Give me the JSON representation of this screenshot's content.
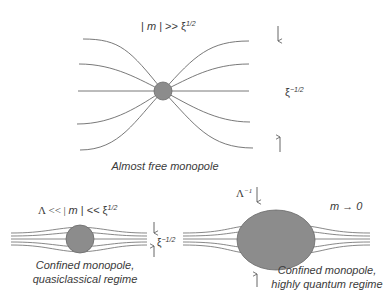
{
  "panels": {
    "free": {
      "condition": {
        "lhs": "| ",
        "var": "m",
        "rel": " | >> ξ",
        "exp": "1/2"
      },
      "width_label": {
        "base": "ξ",
        "exp": "−1/2"
      },
      "caption": "Almost free monopole"
    },
    "quasiclassical": {
      "condition": {
        "pre": "Λ << | ",
        "var": "m",
        "rel": " | << ξ",
        "exp": "1/2"
      },
      "width_label": {
        "base": "ξ",
        "exp": "−1/2"
      },
      "caption_line1": "Confined monopole,",
      "caption_line2": "quasiclassical regime"
    },
    "quantum": {
      "size_label": {
        "base": "Λ",
        "exp": "−1"
      },
      "condition": {
        "var": "m",
        "rel": " → 0"
      },
      "caption_line1": "Confined monopole,",
      "caption_line2": "highly quantum regime"
    }
  },
  "colors": {
    "line": "#555555",
    "monopole_fill": "#8c8c8c",
    "monopole_stroke": "#6a6a6a"
  }
}
